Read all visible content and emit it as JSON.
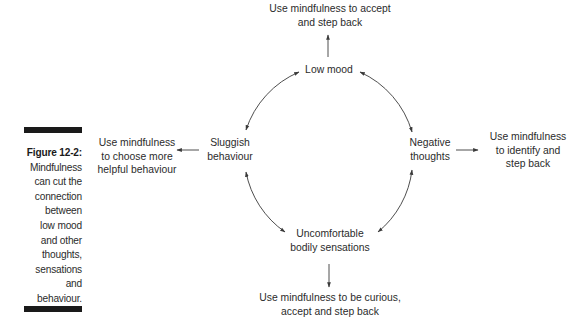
{
  "caption": {
    "figure_number": "Figure 12-2:",
    "text": "Mindfulness\ncan cut the\nconnection\nbetween\nlow mood\nand other\nthoughts,\nsensations\nand\nbehaviour."
  },
  "diagram": {
    "nodes": {
      "low_mood": "Low mood",
      "negative_thoughts": "Negative\nthoughts",
      "bodily_sensations": "Uncomfortable\nbodily sensations",
      "sluggish_behaviour": "Sluggish\nbehaviour"
    },
    "mindfulness_responses": {
      "top": "Use mindfulness to accept\nand step back",
      "right": "Use mindfulness\nto identify and\nstep back",
      "bottom": "Use mindfulness to be curious,\naccept and step back",
      "left": "Use mindfulness\nto choose more\nhelpful behaviour"
    },
    "cycle_links": [
      {
        "from": "low_mood",
        "to": "negative_thoughts",
        "bidirectional": true
      },
      {
        "from": "negative_thoughts",
        "to": "bodily_sensations",
        "bidirectional": true
      },
      {
        "from": "bodily_sensations",
        "to": "sluggish_behaviour",
        "bidirectional": true
      },
      {
        "from": "sluggish_behaviour",
        "to": "low_mood",
        "bidirectional": true
      }
    ],
    "colors": {
      "text": "#2b2b2b",
      "line": "#3a3a3a",
      "caption_bar": "#1a1a1a"
    }
  }
}
